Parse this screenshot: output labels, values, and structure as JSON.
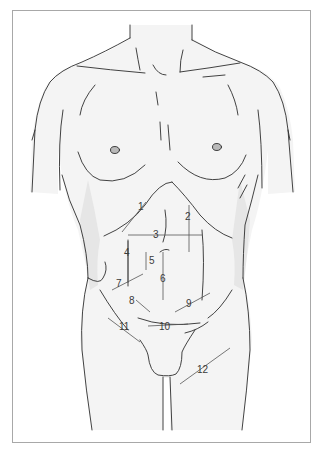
{
  "figure": {
    "colors": {
      "frame_border": "#a8a8a8",
      "outline": "#2e2e2e",
      "skin_fill": "#f4f4f4",
      "shadow_fill": "#e6e6e6",
      "nipple_fill": "#b9b9b9",
      "label_text": "#3a3a3a",
      "leader_line": "#555555"
    },
    "labels": [
      {
        "id": 1,
        "text": "1",
        "x": 138,
        "y": 207
      },
      {
        "id": 2,
        "text": "2",
        "x": 185,
        "y": 212
      },
      {
        "id": 3,
        "text": "3",
        "x": 153,
        "y": 232
      },
      {
        "id": 4,
        "text": "4",
        "x": 125,
        "y": 250
      },
      {
        "id": 5,
        "text": "5",
        "x": 148,
        "y": 258
      },
      {
        "id": 6,
        "text": "6",
        "x": 161,
        "y": 276
      },
      {
        "id": 7,
        "text": "7",
        "x": 117,
        "y": 281
      },
      {
        "id": 8,
        "text": "8",
        "x": 130,
        "y": 298
      },
      {
        "id": 9,
        "text": "9",
        "x": 187,
        "y": 300
      },
      {
        "id": 10,
        "text": "10",
        "x": 160,
        "y": 324
      },
      {
        "id": 11,
        "text": "11",
        "x": 120,
        "y": 324
      },
      {
        "id": 12,
        "text": "12",
        "x": 198,
        "y": 366
      }
    ]
  }
}
